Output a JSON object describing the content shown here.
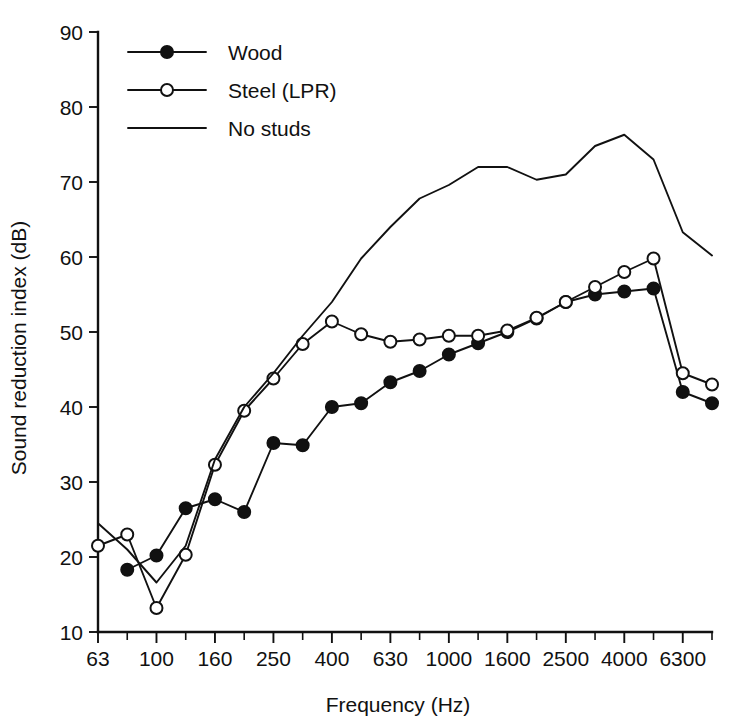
{
  "chart_data": {
    "type": "line",
    "title": "",
    "xlabel": "Frequency (Hz)",
    "ylabel": "Sound reduction index (dB)",
    "xlim": [
      63,
      8000
    ],
    "ylim": [
      10,
      90
    ],
    "ytick_step": 10,
    "grid": false,
    "legend_position": "top-left",
    "x_scale": "one-third-octave-bands",
    "categories": [
      63,
      80,
      100,
      125,
      160,
      200,
      250,
      315,
      400,
      500,
      630,
      800,
      1000,
      1250,
      1600,
      2000,
      2500,
      3150,
      4000,
      5000,
      6300,
      8000
    ],
    "xtick_labels": [
      "63",
      "",
      "100",
      "",
      "160",
      "",
      "250",
      "",
      "400",
      "",
      "630",
      "",
      "1000",
      "",
      "1600",
      "",
      "2500",
      "",
      "4000",
      "",
      "6300",
      ""
    ],
    "xtick_labels_visible": [
      "63",
      "100",
      "160",
      "250",
      "400",
      "630",
      "1000",
      "1600",
      "2500",
      "4000",
      "6300"
    ],
    "ytick_labels": [
      "10",
      "20",
      "30",
      "40",
      "50",
      "60",
      "70",
      "80",
      "90"
    ],
    "ytick_values": [
      10,
      20,
      30,
      40,
      50,
      60,
      70,
      80,
      90
    ],
    "series": [
      {
        "name": "Wood",
        "marker": "filled-circle",
        "x": [
          80,
          100,
          125,
          160,
          200,
          250,
          315,
          400,
          500,
          630,
          800,
          1000,
          1250,
          1600,
          2000,
          2500,
          3150,
          4000,
          5000,
          6300,
          8000
        ],
        "values": [
          18.3,
          20.2,
          26.5,
          27.7,
          26.0,
          35.2,
          34.9,
          40.0,
          40.5,
          43.3,
          44.8,
          47.0,
          48.5,
          50.0,
          51.8,
          54.0,
          55.0,
          55.4,
          55.8,
          42.0,
          40.5
        ]
      },
      {
        "name": "Steel (LPR)",
        "marker": "open-circle",
        "x": [
          63,
          80,
          100,
          125,
          160,
          200,
          250,
          315,
          400,
          500,
          630,
          800,
          1000,
          1250,
          1600,
          2000,
          2500,
          3150,
          4000,
          5000,
          6300,
          8000
        ],
        "values": [
          21.5,
          23.0,
          13.2,
          20.3,
          32.3,
          39.5,
          43.8,
          48.4,
          51.4,
          49.7,
          48.7,
          49.0,
          49.5,
          49.5,
          50.2,
          51.9,
          54.0,
          56.0,
          58.0,
          59.8,
          44.5,
          43.0
        ]
      },
      {
        "name": "No studs",
        "marker": "none",
        "x": [
          63,
          80,
          100,
          125,
          160,
          200,
          250,
          315,
          400,
          500,
          630,
          800,
          1000,
          1250,
          1600,
          2000,
          2500,
          3150,
          4000,
          5000,
          6300,
          8000
        ],
        "values": [
          24.5,
          21.0,
          16.6,
          21.5,
          33.0,
          40.0,
          44.5,
          49.5,
          54.0,
          59.8,
          64.0,
          67.8,
          69.6,
          72.0,
          72.0,
          70.3,
          71.0,
          74.8,
          76.3,
          73.0,
          63.3,
          60.2
        ]
      }
    ]
  },
  "legend": {
    "items": [
      {
        "label": "Wood"
      },
      {
        "label": "Steel (LPR)"
      },
      {
        "label": "No studs"
      }
    ]
  }
}
